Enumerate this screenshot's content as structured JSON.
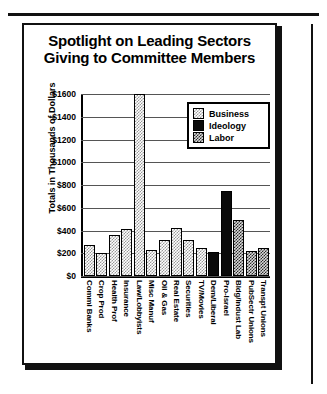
{
  "chart_data": {
    "type": "bar",
    "title": "Spotlight on Leading Sectors Giving to Committee Members",
    "title_line1": "Spotlight on Leading Sectors",
    "title_line2": "Giving to Committee Members",
    "xlabel": "",
    "ylabel": "Totals in Thousands of Dollars",
    "ylim": [
      0,
      1600
    ],
    "ytick_labels": [
      "$1600",
      "$1400",
      "$1200",
      "$1000",
      "$800",
      "$600",
      "$400",
      "$200",
      "$0"
    ],
    "ytick_values": [
      1600,
      1400,
      1200,
      1000,
      800,
      600,
      400,
      200,
      0
    ],
    "grid": true,
    "legend_position": "upper-center-right",
    "legend": [
      {
        "label": "Business",
        "key": "business",
        "pattern": "light-dither"
      },
      {
        "label": "Ideology",
        "key": "ideology",
        "pattern": "solid-black"
      },
      {
        "label": "Labor",
        "key": "labor",
        "pattern": "dark-dither"
      }
    ],
    "categories": [
      "Comml Banks",
      "Crop Prod",
      "Health Prof",
      "Insurance",
      "Law/Lobbyists",
      "Misc Manuf",
      "Oil & Gas",
      "Real Estate",
      "Securities",
      "TV/Movies",
      "Dem/Liberal",
      "Pro-Israel",
      "Bldg/Indust Lab",
      "PubSectr Unions",
      "Transpt Unions"
    ],
    "values": [
      270,
      205,
      360,
      415,
      1600,
      225,
      320,
      420,
      320,
      250,
      215,
      750,
      490,
      220,
      250
    ],
    "groups": [
      "business",
      "business",
      "business",
      "business",
      "business",
      "business",
      "business",
      "business",
      "business",
      "business",
      "ideology",
      "ideology",
      "labor",
      "labor",
      "labor"
    ]
  }
}
